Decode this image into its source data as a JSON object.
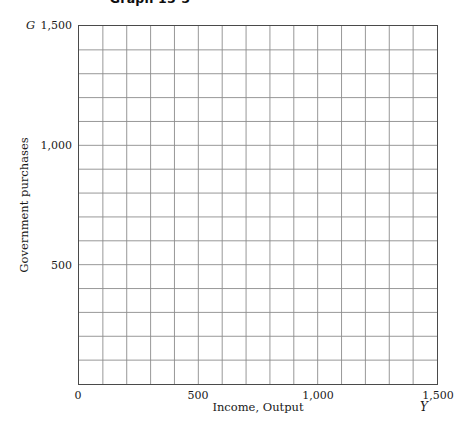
{
  "title": "Graph 15-5",
  "chart_data": {
    "type": "line",
    "title": "Graph 15-5",
    "subtitle": "",
    "xlabel": "Income, Output",
    "ylabel": "Government purchases",
    "x_variable": "Y",
    "y_variable": "G",
    "xlim": [
      0,
      1500
    ],
    "ylim": [
      0,
      1500
    ],
    "grid": true,
    "grid_columns": 15,
    "grid_rows": 15,
    "grid_step": 100,
    "legend": "none",
    "annotations": [],
    "series": [],
    "x_tick_labels": [
      "0",
      "500",
      "1,000",
      "1,500"
    ],
    "x_tick_values": [
      0,
      500,
      1000,
      1500
    ],
    "y_tick_labels": [
      "500",
      "1,000",
      "1,500"
    ],
    "y_tick_values": [
      500,
      1000,
      1500
    ],
    "colors": {
      "grid_line": "#8c8c8c",
      "frame": "#4a4a4a",
      "background": "#ffffff",
      "text": "#1a1a1a"
    }
  }
}
